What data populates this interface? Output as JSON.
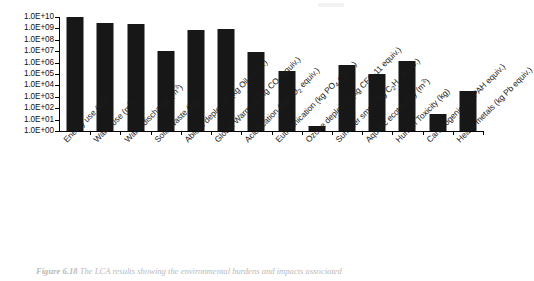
{
  "figure": {
    "caption_number": "Figure 6.18",
    "caption_text": "The LCA results showing the environmental burdens and impacts associated"
  },
  "chart_data": {
    "type": "bar",
    "title": "",
    "xlabel": "",
    "ylabel": "",
    "scale": "log",
    "grid": false,
    "legend": "none",
    "ylim": [
      1,
      10000000000
    ],
    "ytick_labels": [
      "1.0E+10",
      "1.0E+09",
      "1.0E+08",
      "1.0E+07",
      "1.0E+06",
      "1.0E+05",
      "1.0E+04",
      "1.0E+03",
      "1.0E+02",
      "1.0E+01",
      "1.0E+00"
    ],
    "ytick_values": [
      10000000000,
      1000000000,
      100000000,
      10000000,
      1000000,
      100000,
      10000,
      1000,
      100,
      10,
      1
    ],
    "categories": [
      "Energy use (MJ)",
      "Water use (m3)",
      "Water discharge (m3)",
      "Solid waste (kg)",
      "Abiotic depletion (kg Oil equiv.)",
      "Global Warming (kg CO2 equiv.)",
      "Acidification (kg SO2 equiv.)",
      "Eutrophication (kg PO4 equiv.)",
      "Ozone depletion (kg CFC-11 equiv.)",
      "Summer smog (kg C2H4 equiv.)",
      "Aquatic ecotoxicity (m3)",
      "Human Toxicity (kg)",
      "Carcinogenic (kg PAH equiv.)",
      "Heavy metals (kg Pb equiv.)"
    ],
    "categories_rich": [
      {
        "name": "Energy use",
        "unit_pre": "MJ",
        "unit_sub": "",
        "unit_post": ""
      },
      {
        "name": "Water use",
        "unit_pre": "m",
        "unit_sup": "3",
        "unit_post": ""
      },
      {
        "name": "Water discharge",
        "unit_pre": "m",
        "unit_sup": "3",
        "unit_post": ""
      },
      {
        "name": "Solid waste",
        "unit_pre": "kg",
        "unit_sub": "",
        "unit_post": ""
      },
      {
        "name": "Abiotic depletion",
        "unit_pre": "kg Oil equiv.",
        "unit_sub": "",
        "unit_post": ""
      },
      {
        "name": "Global Warming",
        "unit_pre": "kg CO",
        "unit_sub": "2",
        "unit_post": " equiv."
      },
      {
        "name": "Acidification",
        "unit_pre": "kg SO",
        "unit_sub": "2",
        "unit_post": " equiv."
      },
      {
        "name": "Eutrophication",
        "unit_pre": "kg PO",
        "unit_sub": "4",
        "unit_post": " equiv."
      },
      {
        "name": "Ozone depletion",
        "unit_pre": "kg CFC-11 equiv.",
        "unit_sub": "",
        "unit_post": ""
      },
      {
        "name": "Summer smog",
        "unit_pre": "kg C",
        "unit_sub": "2",
        "unit_mid": "H",
        "unit_sub2": "4",
        "unit_post": " equiv."
      },
      {
        "name": "Aquatic ecotoxicity",
        "unit_pre": "m",
        "unit_sup": "3",
        "unit_post": ""
      },
      {
        "name": "Human Toxicity",
        "unit_pre": "kg",
        "unit_sub": "",
        "unit_post": ""
      },
      {
        "name": "Carcinogenic",
        "unit_pre": "kg PAH equiv.",
        "unit_sub": "",
        "unit_post": ""
      },
      {
        "name": "Heavy metals",
        "unit_pre": "kg Pb equiv.",
        "unit_sub": "",
        "unit_post": ""
      }
    ],
    "values": [
      10000000000,
      3000000000,
      2500000000,
      10000000,
      700000000,
      900000000,
      8000000,
      200000,
      3,
      600000,
      100000,
      1500000,
      30,
      3000
    ],
    "bar_color": "#171717",
    "series": [
      {
        "name": "Environmental burdens and impacts",
        "values": [
          10000000000,
          3000000000,
          2500000000,
          10000000,
          700000000,
          900000000,
          8000000,
          200000,
          3,
          600000,
          100000,
          1500000,
          30,
          3000
        ]
      }
    ]
  }
}
